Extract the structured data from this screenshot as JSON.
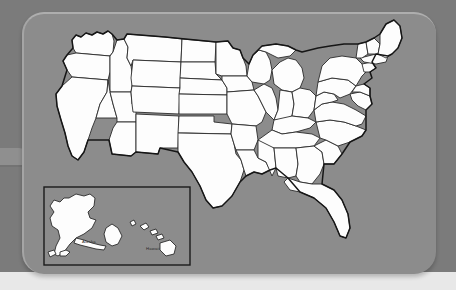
{
  "image": {
    "title": "United States map",
    "description": "Outline map of the United States with state borders, shown on a rounded grey card panel, with an inset box containing Alaska and Hawaii."
  },
  "panel": {
    "name": "map-card-panel",
    "background_color": "#8c8c8c",
    "corner_radius_px": 22
  },
  "canvas": {
    "background_color": "#7b7b7b",
    "bottom_strip_color": "#e8e8e8",
    "width": 456,
    "height": 290
  },
  "map": {
    "name": "united-states-map",
    "land_fill_color": "#fdfdfd",
    "border_stroke_color": "#2b2b2b",
    "outline_stroke_color": "#161616",
    "water_color": "#8c8c8c",
    "regions": [
      "Contiguous United States",
      "Alaska",
      "Hawaii"
    ]
  },
  "inset": {
    "name": "alaska-hawaii-inset",
    "border_color": "#1a1a1a",
    "labels": [
      {
        "id": "alaska-label",
        "text": "Alaska"
      },
      {
        "id": "hawaii-label",
        "text": "Hawaii"
      }
    ]
  },
  "decorations": {
    "left_tab": {
      "name": "left-edge-tab",
      "color": "#8f8f8f"
    }
  }
}
